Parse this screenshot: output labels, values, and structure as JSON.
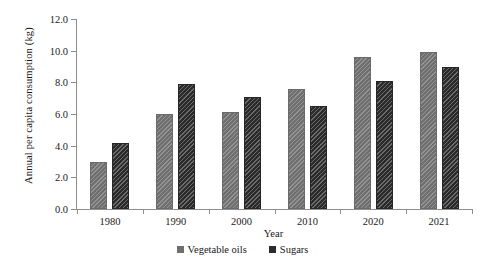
{
  "chart_data": {
    "type": "bar",
    "title": "",
    "subtitle": "",
    "xlabel": "Year",
    "ylabel": "Annual per capita consumption (kg)",
    "categories": [
      "1980",
      "1990",
      "2000",
      "2010",
      "2020",
      "2021"
    ],
    "series": [
      {
        "name": "Vegetable oils",
        "color": "#6F6F6F",
        "pattern": "diagonal-hatch",
        "values": [
          3.0,
          6.0,
          6.1,
          7.6,
          9.6,
          9.9
        ]
      },
      {
        "name": "Sugars",
        "color": "#2B2B2B",
        "pattern": "dense-diagonal-hatch",
        "values": [
          4.2,
          7.9,
          7.1,
          6.5,
          8.1,
          9.0
        ]
      }
    ],
    "ylim": [
      0,
      12
    ],
    "ytick_values": [
      0,
      2,
      4,
      6,
      8,
      10,
      12
    ],
    "ytick_labels": [
      "0.0",
      "2.0",
      "4.0",
      "6.0",
      "8.0",
      "10.0",
      "12.0"
    ],
    "grid": false,
    "legend_position": "bottom-center",
    "legend_entries": [
      "Vegetable oils",
      "Sugars"
    ],
    "axis_color": "#8E8E8E",
    "background": "#FFFFFF"
  }
}
